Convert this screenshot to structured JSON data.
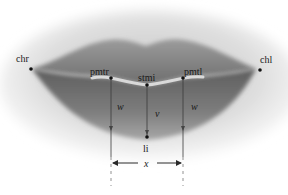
{
  "figure": {
    "landmarks": [
      {
        "id": "chr",
        "label": "chr"
      },
      {
        "id": "pmtr",
        "label": "pmtr"
      },
      {
        "id": "stmi",
        "label": "stmi"
      },
      {
        "id": "pmtl",
        "label": "pmtl"
      },
      {
        "id": "chl",
        "label": "chl"
      },
      {
        "id": "li",
        "label": "li"
      }
    ],
    "measurements": [
      {
        "id": "w-left",
        "label": "w"
      },
      {
        "id": "v",
        "label": "v"
      },
      {
        "id": "w-right",
        "label": "w"
      },
      {
        "id": "x",
        "label": "x"
      }
    ],
    "colors": {
      "lip_dark": "#6f6f6f",
      "lip_mid": "#8a8a8a",
      "skin": "#d9d9d9",
      "annotation": "#2a2a2a"
    }
  }
}
